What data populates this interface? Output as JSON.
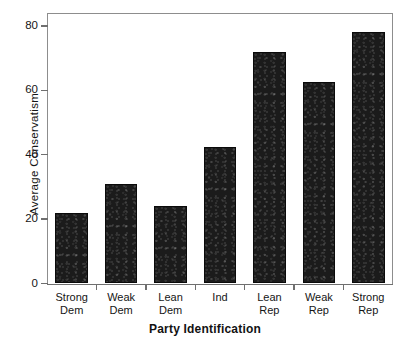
{
  "chart_data": {
    "type": "bar",
    "title": "",
    "xlabel": "Party Identification",
    "ylabel": "Average Conservatism",
    "categories": [
      "Strong Dem",
      "Weak Dem",
      "Lean Dem",
      "Ind",
      "Lean Rep",
      "Weak Rep",
      "Strong Rep"
    ],
    "category_lines": [
      [
        "Strong",
        "Dem"
      ],
      [
        "Weak",
        "Dem"
      ],
      [
        "Lean",
        "Dem"
      ],
      [
        "Ind",
        ""
      ],
      [
        "Lean",
        "Rep"
      ],
      [
        "Weak",
        "Rep"
      ],
      [
        "Strong",
        "Rep"
      ]
    ],
    "values": [
      22,
      31,
      24,
      42.5,
      72,
      62.5,
      78
    ],
    "ylim": [
      0,
      84
    ],
    "yticks": [
      0,
      20,
      40,
      60,
      80
    ],
    "ytick_labels": [
      "0",
      "20",
      "40",
      "60",
      "80"
    ],
    "xlim": [
      0,
      7
    ],
    "grid": false,
    "legend": null,
    "bar_color": "#1b1b1b",
    "axis_color": "#6f6f6f",
    "frame_color": "#8d8d8d",
    "background": "#ffffff"
  }
}
